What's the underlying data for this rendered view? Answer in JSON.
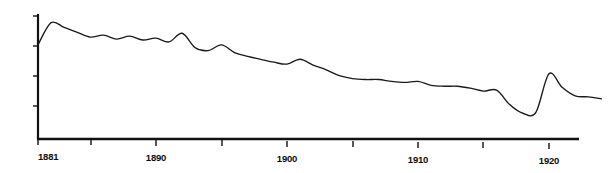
{
  "figure": {
    "background_color": "#ffffff",
    "line_color": "#1a1a1a",
    "axis_color": "#111111",
    "width": 609,
    "height": 173
  },
  "axes": {
    "x_tick_labels": [
      "1881",
      "1890",
      "1900",
      "1910",
      "1920"
    ],
    "x_tick_label_years": [
      1881,
      1890,
      1900,
      1910,
      1920
    ],
    "x_unlabeled_tick_years": [
      1885,
      1895,
      1905,
      1915
    ],
    "y_tick_count": 4
  },
  "chart_data": {
    "type": "line",
    "title": "",
    "subtitle": "",
    "xlabel": "",
    "ylabel": "",
    "grid": false,
    "legend": false,
    "legend_position": "none",
    "xlim": [
      1881,
      1924
    ],
    "ylim": [
      0,
      100
    ],
    "x": [
      1881,
      1882,
      1883,
      1884,
      1885,
      1886,
      1887,
      1888,
      1889,
      1890,
      1891,
      1892,
      1893,
      1894,
      1895,
      1896,
      1897,
      1898,
      1899,
      1900,
      1901,
      1902,
      1903,
      1904,
      1905,
      1906,
      1907,
      1908,
      1909,
      1910,
      1911,
      1912,
      1913,
      1914,
      1915,
      1916,
      1917,
      1918,
      1919,
      1920,
      1921,
      1922,
      1923,
      1924
    ],
    "series": [
      {
        "name": "rate",
        "values": [
          79.0,
          90.5,
          88.0,
          85.5,
          83.0,
          84.0,
          82.0,
          83.5,
          81.5,
          82.5,
          80.5,
          85.0,
          77.5,
          76.0,
          79.0,
          75.0,
          73.0,
          71.5,
          70.0,
          69.0,
          71.5,
          68.5,
          66.0,
          63.0,
          61.5,
          61.0,
          61.0,
          60.0,
          59.5,
          60.0,
          58.0,
          57.5,
          57.5,
          56.5,
          55.0,
          55.5,
          48.0,
          43.5,
          44.0,
          64.0,
          57.0,
          52.5,
          52.0,
          51.0
        ]
      }
    ],
    "annotations": [
      {
        "label": "peak",
        "year": 1920
      },
      {
        "label": "trough",
        "year": 1918
      }
    ]
  }
}
